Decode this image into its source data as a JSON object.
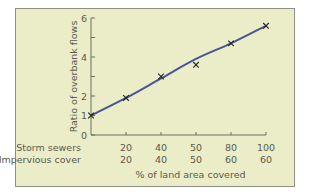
{
  "chart_data": {
    "type": "line",
    "title": "",
    "xlabel": "% of land area covered",
    "ylabel": "Ratio of overbank flows",
    "ylim": [
      0,
      6
    ],
    "yticks": [
      0,
      2,
      4,
      6
    ],
    "yticks_minor": [
      1,
      3,
      5
    ],
    "grid": false,
    "x_rows": [
      {
        "label": "Storm sewers",
        "values": [
          "20",
          "40",
          "50",
          "80",
          "100"
        ]
      },
      {
        "label": "Impervious cover",
        "values": [
          "20",
          "40",
          "50",
          "60",
          "60"
        ]
      }
    ],
    "categories": [
      "0",
      "20/20",
      "40/40",
      "50/50",
      "80/60",
      "100/60"
    ],
    "series": [
      {
        "name": "observed (x markers)",
        "marker": "x",
        "values": [
          1.0,
          1.9,
          3.0,
          3.6,
          4.7,
          5.6
        ]
      },
      {
        "name": "fitted curve",
        "line": true,
        "values": [
          1.0,
          1.9,
          2.9,
          3.9,
          4.7,
          5.6
        ]
      }
    ],
    "colors": {
      "line": "#4a5596",
      "marker": "#222222",
      "axis": "#6e6e60",
      "panel_bg": "#eaedc8",
      "panel_border": "#8f8f86"
    }
  }
}
